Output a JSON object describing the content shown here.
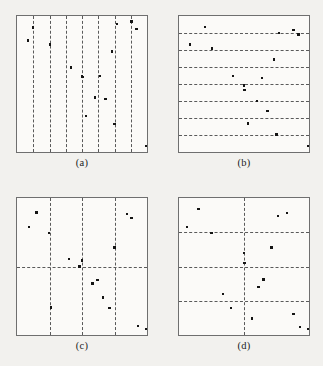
{
  "figure": {
    "background_color": "#f2f1ee",
    "panel_fill_color": "#fbfaf8",
    "frame_color": "#6f6f6f",
    "gridline_color": "#5a5a5a",
    "point_color": "#141414",
    "gridline_style": "dashed",
    "n_points": 16
  },
  "chart_data": [
    {
      "type": "scatter",
      "panel": "a",
      "caption": "(a)",
      "title": "Vertical strip stratification",
      "xlabel": "",
      "ylabel": "",
      "xlim": [
        0,
        1
      ],
      "ylim": [
        0,
        1
      ],
      "grid": true,
      "legend": "none",
      "strata": "8 equal-width vertical strips",
      "vlines": [
        0.125,
        0.25,
        0.375,
        0.5,
        0.625,
        0.75,
        0.875
      ],
      "hlines": [],
      "x": [
        0.125,
        0.085,
        0.255,
        0.415,
        0.5,
        0.505,
        0.53,
        0.6,
        0.64,
        0.68,
        0.73,
        0.75,
        0.77,
        0.88,
        0.92,
        0.99
      ],
      "y": [
        0.915,
        0.82,
        0.79,
        0.62,
        0.555,
        0.55,
        0.265,
        0.4,
        0.56,
        0.39,
        0.74,
        0.205,
        0.94,
        0.96,
        0.905,
        0.045
      ]
    },
    {
      "type": "scatter",
      "panel": "b",
      "caption": "(b)",
      "title": "Horizontal strip stratification",
      "xlabel": "",
      "ylabel": "",
      "xlim": [
        0,
        1
      ],
      "ylim": [
        0,
        1
      ],
      "grid": true,
      "legend": "none",
      "strata": "8 equal-height horizontal strips",
      "vlines": [],
      "hlines": [
        0.125,
        0.25,
        0.375,
        0.5,
        0.625,
        0.75,
        0.875
      ],
      "x": [
        0.2,
        0.085,
        0.255,
        0.415,
        0.5,
        0.505,
        0.53,
        0.6,
        0.64,
        0.68,
        0.73,
        0.75,
        0.77,
        0.88,
        0.92,
        0.99
      ],
      "y": [
        0.92,
        0.79,
        0.76,
        0.56,
        0.49,
        0.455,
        0.21,
        0.375,
        0.545,
        0.3,
        0.68,
        0.13,
        0.875,
        0.895,
        0.865,
        0.045
      ]
    },
    {
      "type": "scatter",
      "panel": "c",
      "caption": "(c)",
      "title": "Four vertical strips crossed with one horizontal split",
      "xlabel": "",
      "ylabel": "",
      "xlim": [
        0,
        1
      ],
      "ylim": [
        0,
        1
      ],
      "grid": true,
      "legend": "none",
      "strata": "4 columns x 2 rows",
      "vlines": [
        0.25,
        0.5,
        0.75
      ],
      "hlines": [
        0.5
      ],
      "x": [
        0.15,
        0.09,
        0.245,
        0.26,
        0.4,
        0.48,
        0.5,
        0.58,
        0.62,
        0.66,
        0.71,
        0.75,
        0.845,
        0.88,
        0.93,
        0.99
      ],
      "y": [
        0.895,
        0.79,
        0.745,
        0.2,
        0.555,
        0.5,
        0.545,
        0.375,
        0.4,
        0.275,
        0.195,
        0.64,
        0.885,
        0.855,
        0.065,
        0.045
      ]
    },
    {
      "type": "scatter",
      "panel": "d",
      "caption": "(d)",
      "title": "Two vertical strips crossed with three horizontal splits",
      "xlabel": "",
      "ylabel": "",
      "xlim": [
        0,
        1
      ],
      "ylim": [
        0,
        1
      ],
      "grid": true,
      "legend": "none",
      "strata": "2 columns x 4 rows",
      "vlines": [
        0.5
      ],
      "hlines": [
        0.25,
        0.5,
        0.75
      ],
      "x": [
        0.15,
        0.06,
        0.25,
        0.34,
        0.4,
        0.5,
        0.505,
        0.56,
        0.61,
        0.65,
        0.71,
        0.76,
        0.83,
        0.88,
        0.93,
        0.99
      ],
      "y": [
        0.92,
        0.79,
        0.745,
        0.3,
        0.195,
        0.6,
        0.525,
        0.12,
        0.35,
        0.405,
        0.64,
        0.87,
        0.89,
        0.155,
        0.06,
        0.045
      ]
    }
  ],
  "panels": {
    "a": {
      "caption": "(a)"
    },
    "b": {
      "caption": "(b)"
    },
    "c": {
      "caption": "(c)"
    },
    "d": {
      "caption": "(d)"
    }
  }
}
